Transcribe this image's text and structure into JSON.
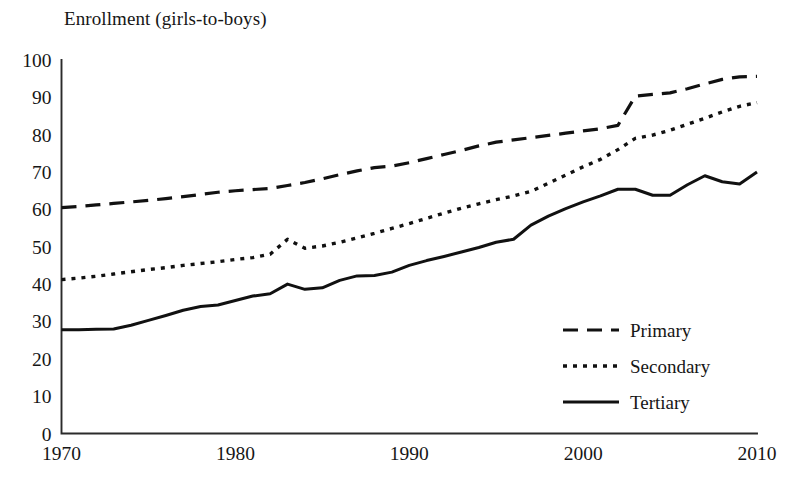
{
  "chart_data": {
    "type": "line",
    "title": "Enrollment (girls-to-boys)",
    "xlabel": "",
    "ylabel": "",
    "grid": false,
    "legend_position": "inside-bottom-right",
    "xlim": [
      1970,
      2010
    ],
    "ylim": [
      0,
      100
    ],
    "x_ticks": [
      "1970",
      "1980",
      "1990",
      "2000",
      "2010"
    ],
    "y_ticks": [
      "0",
      "10",
      "20",
      "30",
      "40",
      "50",
      "60",
      "70",
      "80",
      "90",
      "100"
    ],
    "x": [
      1970,
      1971,
      1972,
      1973,
      1974,
      1975,
      1976,
      1977,
      1978,
      1979,
      1980,
      1981,
      1982,
      1983,
      1984,
      1985,
      1986,
      1987,
      1988,
      1989,
      1990,
      1991,
      1992,
      1993,
      1994,
      1995,
      1996,
      1997,
      1998,
      1999,
      2000,
      2001,
      2002,
      2003,
      2004,
      2005,
      2006,
      2007,
      2008,
      2009,
      2010
    ],
    "series": [
      {
        "name": "Primary",
        "style": "dashed",
        "values": [
          60.5,
          60.8,
          61.2,
          61.6,
          62.0,
          62.4,
          62.9,
          63.4,
          64.0,
          64.6,
          65.0,
          65.3,
          65.6,
          66.4,
          67.2,
          68.2,
          69.3,
          70.3,
          71.2,
          71.6,
          72.5,
          73.6,
          74.7,
          75.8,
          77.0,
          78.0,
          78.6,
          79.2,
          79.8,
          80.4,
          81.0,
          81.6,
          82.5,
          90.3,
          90.8,
          91.2,
          92.3,
          93.6,
          94.8,
          95.5,
          95.6
        ]
      },
      {
        "name": "Secondary",
        "style": "dotted",
        "values": [
          41.2,
          41.6,
          42.1,
          42.7,
          43.3,
          43.9,
          44.4,
          45.0,
          45.5,
          46.0,
          46.6,
          47.1,
          48.0,
          52.0,
          49.6,
          50.2,
          51.2,
          52.4,
          53.6,
          54.9,
          56.2,
          57.6,
          59.0,
          60.3,
          61.5,
          62.6,
          63.6,
          64.8,
          67.0,
          69.2,
          71.4,
          73.4,
          76.0,
          79.0,
          79.9,
          81.2,
          82.8,
          84.4,
          86.1,
          87.6,
          88.6
        ]
      },
      {
        "name": "Tertiary",
        "style": "solid",
        "values": [
          27.8,
          27.8,
          27.9,
          28.0,
          29.0,
          30.3,
          31.6,
          33.0,
          34.0,
          34.4,
          35.6,
          36.8,
          37.4,
          40.0,
          38.6,
          39.0,
          41.0,
          42.2,
          42.3,
          43.2,
          45.0,
          46.3,
          47.4,
          48.6,
          49.8,
          51.2,
          52.0,
          55.8,
          58.2,
          60.2,
          62.0,
          63.6,
          65.4,
          65.4,
          63.8,
          63.8,
          66.6,
          69.0,
          67.4,
          66.8,
          70.0
        ]
      }
    ]
  },
  "legend": {
    "items": [
      {
        "label": "Primary"
      },
      {
        "label": "Secondary"
      },
      {
        "label": "Tertiary"
      }
    ]
  },
  "colors": {
    "ink": "#111111",
    "axis": "#2b2b2b",
    "background": "#ffffff"
  }
}
